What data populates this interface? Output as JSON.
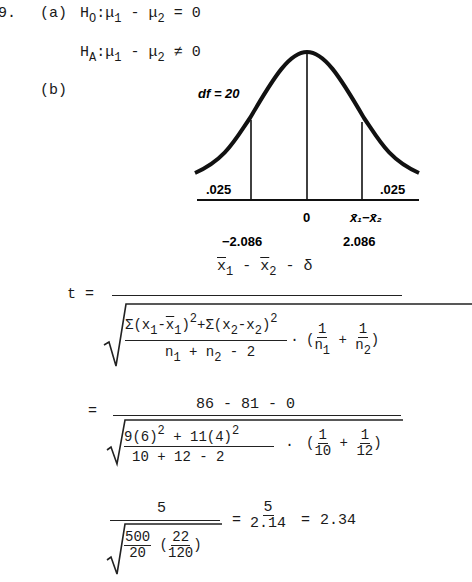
{
  "problem": {
    "number": "9.",
    "part_a_label": "(a)",
    "part_b_label": "(b)",
    "h0": {
      "lhs": "H",
      "lhs_sub": "O",
      "mu1": "μ",
      "sub1": "1",
      "op": "-",
      "mu2": "μ",
      "sub2": "2",
      "rel": "=",
      "rhs": "0"
    },
    "ha": {
      "lhs": "H",
      "lhs_sub": "A",
      "mu1": "μ",
      "sub1": "1",
      "op": "-",
      "mu2": "μ",
      "sub2": "2",
      "rel": "≠",
      "rhs": "0"
    }
  },
  "diagram": {
    "df_label": "df = 20",
    "left_tail": ".025",
    "right_tail": ".025",
    "center_label": "0",
    "axis_label": "x̄₁−x̄₂",
    "left_critical": "−2.086",
    "right_critical": "2.086"
  },
  "formula": {
    "t_label": "t =",
    "numerator": "x̄₁ - x̄₂ - δ",
    "inner_numerator": "Σ(x₁-x̄₁)² + Σ(x₂-x₂)²",
    "inner_denominator": "n₁ + n₂ - 2",
    "dot": "·",
    "one": "1",
    "n1": "n₁",
    "n2": "n₂",
    "plus": "+"
  },
  "substitution": {
    "eq": "=",
    "numerator": "86 - 81 - 0",
    "inner_numerator": "9(6)² + 11(4)²",
    "inner_denominator": "10 + 12 - 2",
    "frac1_num": "1",
    "frac1_den": "10",
    "frac2_num": "1",
    "frac2_den": "12"
  },
  "result": {
    "numerator": "5",
    "root_a_num": "500",
    "root_a_den": "20",
    "root_b_num": "22",
    "root_b_den": "120",
    "eq1": "=",
    "mid_num": "5",
    "mid_den": "2.14",
    "eq2": "=",
    "value": "2.34"
  }
}
